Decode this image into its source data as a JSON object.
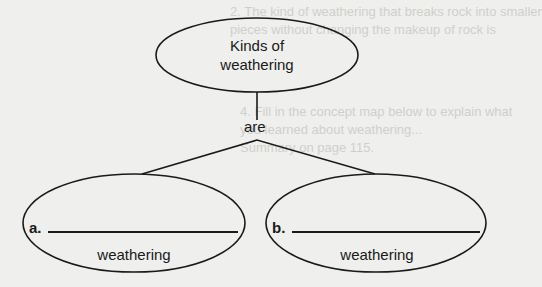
{
  "background_text": [
    "2.  The kind of weathering that breaks rock into smaller",
    "     pieces without changing the makeup of rock is",
    "4.  Fill in the concept map below to explain what",
    "     you learned about weathering...",
    "     Summary on page 115."
  ],
  "concept_map": {
    "root": {
      "line1": "Kinds of",
      "line2": "weathering"
    },
    "connector": "are",
    "children": [
      {
        "label": "a.",
        "blank_value": "",
        "suffix": "weathering"
      },
      {
        "label": "b.",
        "blank_value": "",
        "suffix": "weathering"
      }
    ]
  },
  "colors": {
    "ink": "#1a1a1a",
    "paper": "#efefed",
    "faint": "#cfcfcc"
  }
}
